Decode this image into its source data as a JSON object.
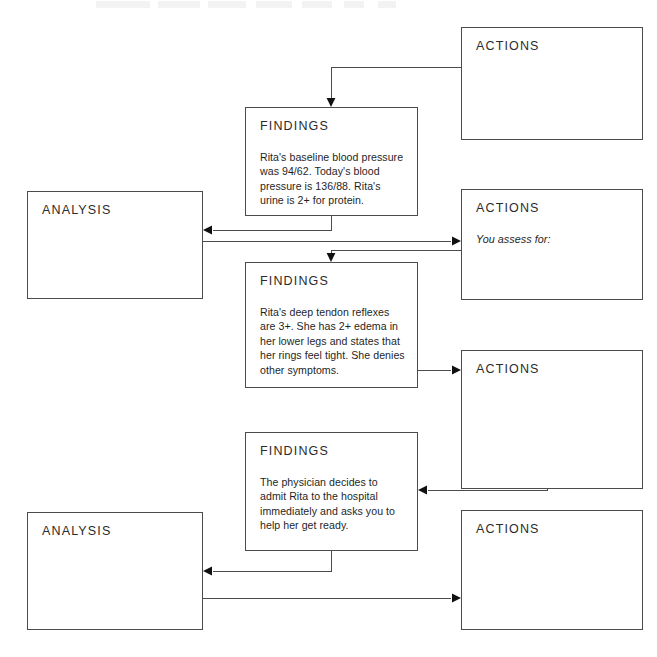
{
  "diagram": {
    "type": "clinical-reasoning-flowchart",
    "canvas": {
      "width": 657,
      "height": 657
    },
    "ink_color": "#4c4c4c",
    "text_color": "#1f1f1f",
    "background": "#ffffff",
    "nodes": [
      {
        "id": "actions-1",
        "title": "ACTIONS",
        "body": "",
        "italic": false,
        "x": 461,
        "y": 27,
        "w": 182,
        "h": 113
      },
      {
        "id": "findings-1",
        "title": "FINDINGS",
        "body": "Rita's baseline blood pressure was 94/62. Today's blood pressure is 136/88. Rita's urine is 2+ for protein.",
        "italic": false,
        "x": 245,
        "y": 107,
        "w": 173,
        "h": 109
      },
      {
        "id": "analysis-1",
        "title": "ANALYSIS",
        "body": "",
        "italic": false,
        "x": 27,
        "y": 191,
        "w": 176,
        "h": 108
      },
      {
        "id": "actions-2",
        "title": "ACTIONS",
        "body": "You assess for:",
        "italic": true,
        "x": 461,
        "y": 189,
        "w": 182,
        "h": 111
      },
      {
        "id": "findings-2",
        "title": "FINDINGS",
        "body": "Rita's deep tendon reflexes are 3+. She has 2+ edema in her lower legs and states that her rings feel tight. She denies other symptoms.",
        "italic": false,
        "x": 245,
        "y": 262,
        "w": 173,
        "h": 126
      },
      {
        "id": "actions-3",
        "title": "ACTIONS",
        "body": "",
        "italic": false,
        "x": 461,
        "y": 350,
        "w": 182,
        "h": 139
      },
      {
        "id": "findings-3",
        "title": "FINDINGS",
        "body": "The physician decides to admit Rita to the hospital immediately and asks you to help her get ready.",
        "italic": false,
        "x": 245,
        "y": 432,
        "w": 173,
        "h": 119
      },
      {
        "id": "analysis-2",
        "title": "ANALYSIS",
        "body": "",
        "italic": false,
        "x": 27,
        "y": 512,
        "w": 176,
        "h": 118
      },
      {
        "id": "actions-4",
        "title": "ACTIONS",
        "body": "",
        "italic": false,
        "x": 461,
        "y": 510,
        "w": 182,
        "h": 120
      }
    ],
    "connectors": [
      {
        "id": "actions1-to-findings1",
        "from": "actions-1",
        "to": "findings-1",
        "points": "461,67 331,67 331,100",
        "arrow_at": "331,107",
        "arrow_dir": "down"
      },
      {
        "id": "findings1-to-analysis1",
        "from": "findings-1",
        "to": "analysis-1",
        "points": "331,216 331,230 213,230",
        "arrow_at": "203,230",
        "arrow_dir": "left"
      },
      {
        "id": "analysis1-to-actions2",
        "from": "analysis-1",
        "to": "actions-2",
        "points": "203,241 451,241",
        "arrow_at": "461,241",
        "arrow_dir": "right"
      },
      {
        "id": "actions2-to-findings2",
        "from": "actions-2",
        "to": "findings-2",
        "points": "461,250 331,250 331,255",
        "arrow_at": "331,262",
        "arrow_dir": "down"
      },
      {
        "id": "findings2-to-actions3",
        "from": "findings-2",
        "to": "actions-3",
        "points": "418,370 451,370",
        "arrow_at": "461,370",
        "arrow_dir": "right"
      },
      {
        "id": "actions3-to-findings3",
        "from": "actions-3",
        "to": "findings-3",
        "points": "547,489 547,490 428,490",
        "arrow_at": "418,490",
        "arrow_dir": "left"
      },
      {
        "id": "findings3-to-analysis2",
        "from": "findings-3",
        "to": "analysis-2",
        "points": "331,551 331,571 213,571",
        "arrow_at": "203,571",
        "arrow_dir": "left"
      },
      {
        "id": "analysis2-to-actions4",
        "from": "analysis-2",
        "to": "actions-4",
        "points": "203,598 451,598",
        "arrow_at": "461,598",
        "arrow_dir": "right"
      }
    ]
  }
}
